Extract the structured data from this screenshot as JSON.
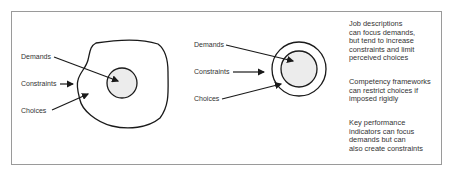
{
  "diagram_left": {
    "labels": {
      "demands": "Demands",
      "constraints": "Constraints",
      "choices": "Choices"
    }
  },
  "diagram_right": {
    "labels": {
      "demands": "Demands",
      "constraints": "Constraints",
      "choices": "Choices"
    }
  },
  "notes": [
    {
      "lines": [
        "Job descriptions",
        "can focus demands,",
        "but tend to increase",
        "constraints and limit",
        "perceived choices"
      ]
    },
    {
      "lines": [
        "Competency frameworks",
        "can restrict choices if",
        "imposed rigidly"
      ]
    },
    {
      "lines": [
        "Key performance",
        "indicators can focus",
        "demands but can",
        "also create constraints"
      ]
    }
  ],
  "colors": {
    "stroke": "#1a1a1a",
    "fill_inner": "#ececec",
    "frame": "#9a9a9a"
  }
}
